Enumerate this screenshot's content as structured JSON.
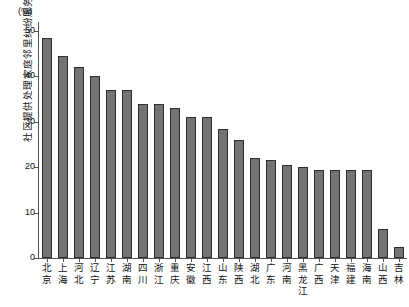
{
  "chart_data": {
    "type": "bar",
    "title": "",
    "subtitle": "",
    "xlabel": "",
    "ylabel": "社区提供处理家庭邻里纠纷服务",
    "unit_label": "(%)",
    "ylim": [
      0,
      52
    ],
    "yticks": [
      0,
      10,
      20,
      30,
      40,
      50
    ],
    "grid": false,
    "legend": null,
    "bar_color": "#737373",
    "bar_edge_color": "#2e2e2e",
    "axis_color": "#555555",
    "categories": [
      "北京",
      "上海",
      "河北",
      "辽宁",
      "江苏",
      "湖南",
      "四川",
      "浙江",
      "重庆",
      "安徽",
      "江西",
      "山东",
      "陕西",
      "湖北",
      "广东",
      "河南",
      "黑龙江",
      "广西",
      "天津",
      "福建",
      "海南",
      "山西",
      "吉林"
    ],
    "values": [
      48.5,
      44.5,
      42.0,
      40.0,
      37.0,
      37.0,
      34.0,
      34.0,
      33.0,
      31.0,
      31.0,
      28.5,
      26.0,
      22.0,
      21.5,
      20.5,
      20.0,
      19.5,
      19.5,
      19.5,
      19.5,
      6.5,
      2.5
    ]
  }
}
